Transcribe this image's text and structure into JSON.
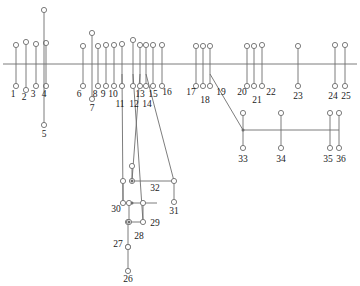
{
  "figure": {
    "kind": "single-line-network-diagram",
    "width": 360,
    "height": 286,
    "background_color": "#ffffff",
    "line_color": "#6e6e6e",
    "node_stroke_color": "#6e6e6e",
    "node_fill_color": "#ffffff",
    "label_color": "#1a1a1a",
    "node_radius": 2.6,
    "stroke_width": 0.9
  },
  "buses": [
    {
      "name": "main-bus",
      "x1": 3,
      "y1": 64,
      "x2": 357,
      "y2": 64
    },
    {
      "name": "lower-right-bus",
      "x1": 243,
      "y1": 130,
      "x2": 339,
      "y2": 130
    },
    {
      "name": "node-32-bus",
      "x1": 132,
      "y1": 181,
      "x2": 174,
      "y2": 181
    },
    {
      "name": "node-29-bus",
      "x1": 132,
      "y1": 203,
      "x2": 157,
      "y2": 203
    },
    {
      "name": "node-28-bus",
      "x1": 129,
      "y1": 222,
      "x2": 143,
      "y2": 222
    }
  ],
  "feeders": [
    {
      "label": "1",
      "x": 16,
      "top_y": 45,
      "bottom_y": 86,
      "label_x": 13,
      "label_y": 90
    },
    {
      "label": "2",
      "x": 26,
      "top_y": 42,
      "bottom_y": 90,
      "label_x": 24,
      "label_y": 93
    },
    {
      "label": "3",
      "x": 36,
      "top_y": 44,
      "bottom_y": 86,
      "label_x": 33,
      "label_y": 90
    },
    {
      "label": "4",
      "x": 46,
      "top_y": 43,
      "bottom_y": 86,
      "label_x": 44,
      "label_y": 90
    },
    {
      "label": "5",
      "x": 44,
      "top_y": 10,
      "bottom_y": 125,
      "label_x": 44,
      "label_y": 130
    },
    {
      "label": "6",
      "x": 83,
      "top_y": 46,
      "bottom_y": 86,
      "label_x": 79,
      "label_y": 90
    },
    {
      "label": "7",
      "x": 92,
      "top_y": 33,
      "bottom_y": 99,
      "label_x": 92,
      "label_y": 104
    },
    {
      "label": "8",
      "x": 98,
      "top_y": 46,
      "bottom_y": 86,
      "label_x": 95,
      "label_y": 90
    },
    {
      "label": "9",
      "x": 106,
      "top_y": 45,
      "bottom_y": 86,
      "label_x": 103,
      "label_y": 90
    },
    {
      "label": "10",
      "x": 114,
      "top_y": 45,
      "bottom_y": 86,
      "label_x": 113,
      "label_y": 90
    },
    {
      "label": "11",
      "x": 122,
      "top_y": 44,
      "bottom_y": 86,
      "label_x": 120,
      "label_y": 100
    },
    {
      "label": "12",
      "x": 133,
      "top_y": 40,
      "bottom_y": 86,
      "label_x": 134,
      "label_y": 100
    },
    {
      "label": "13",
      "x": 140,
      "top_y": 45,
      "bottom_y": 86,
      "label_x": 140,
      "label_y": 90
    },
    {
      "label": "14",
      "x": 146,
      "top_y": 45,
      "bottom_y": 86,
      "label_x": 147,
      "label_y": 100
    },
    {
      "label": "15",
      "x": 153,
      "top_y": 45,
      "bottom_y": 86,
      "label_x": 153,
      "label_y": 90
    },
    {
      "label": "16",
      "x": 162,
      "top_y": 45,
      "bottom_y": 86,
      "label_x": 167,
      "label_y": 88
    },
    {
      "label": "17",
      "x": 196,
      "top_y": 46,
      "bottom_y": 86,
      "label_x": 191,
      "label_y": 88
    },
    {
      "label": "18",
      "x": 203,
      "top_y": 46,
      "bottom_y": 86,
      "label_x": 205,
      "label_y": 96
    },
    {
      "label": "19",
      "x": 210,
      "top_y": 46,
      "bottom_y": 86,
      "label_x": 221,
      "label_y": 88
    },
    {
      "label": "20",
      "x": 247,
      "top_y": 46,
      "bottom_y": 86,
      "label_x": 242,
      "label_y": 88
    },
    {
      "label": "21",
      "x": 254,
      "top_y": 46,
      "bottom_y": 86,
      "label_x": 257,
      "label_y": 96
    },
    {
      "label": "22",
      "x": 262,
      "top_y": 45,
      "bottom_y": 86,
      "label_x": 271,
      "label_y": 88
    },
    {
      "label": "23",
      "x": 298,
      "top_y": 46,
      "bottom_y": 86,
      "label_x": 298,
      "label_y": 92
    },
    {
      "label": "24",
      "x": 335,
      "top_y": 45,
      "bottom_y": 86,
      "label_x": 333,
      "label_y": 92
    },
    {
      "label": "25",
      "x": 345,
      "top_y": 45,
      "bottom_y": 86,
      "label_x": 346,
      "label_y": 92
    },
    {
      "label": "26",
      "x": 128,
      "top_y": 247,
      "bottom_y": 271,
      "label_x": 128,
      "label_y": 275
    },
    {
      "label": "27",
      "x": 128,
      "top_y": 222,
      "bottom_y": 247,
      "label_x": 118,
      "label_y": 240
    },
    {
      "label": "28",
      "x": 129,
      "top_y": 203,
      "bottom_y": 222,
      "label_x": 139,
      "label_y": 232
    },
    {
      "label": "29",
      "x": 143,
      "top_y": 203,
      "bottom_y": 222,
      "label_x": 155,
      "label_y": 219
    },
    {
      "label": "30",
      "x": 123,
      "top_y": 181,
      "bottom_y": 203,
      "label_x": 116,
      "label_y": 205
    },
    {
      "label": "31",
      "x": 174,
      "top_y": 181,
      "bottom_y": 202,
      "label_x": 174,
      "label_y": 207
    },
    {
      "label": "32",
      "x": 132,
      "top_y": 166,
      "bottom_y": 181,
      "label_x": 155,
      "label_y": 184
    },
    {
      "label": "33",
      "x": 243,
      "top_y": 113,
      "bottom_y": 148,
      "label_x": 243,
      "label_y": 155
    },
    {
      "label": "34",
      "x": 281,
      "top_y": 113,
      "bottom_y": 148,
      "label_x": 281,
      "label_y": 155
    },
    {
      "label": "35",
      "x": 330,
      "top_y": 113,
      "bottom_y": 148,
      "label_x": 328,
      "label_y": 155
    },
    {
      "label": "36",
      "x": 339,
      "top_y": 113,
      "bottom_y": 148,
      "label_x": 341,
      "label_y": 155
    }
  ],
  "tie_lines": [
    {
      "name": "tie-19-to-33",
      "x1": 210,
      "y1": 74,
      "x2": 243,
      "y2": 130
    },
    {
      "name": "tie-11-to-30",
      "x1": 122,
      "y1": 74,
      "x2": 123,
      "y2": 203
    },
    {
      "name": "tie-12-to-29",
      "x1": 133,
      "y1": 74,
      "x2": 143,
      "y2": 222
    },
    {
      "name": "tie-14-to-31",
      "x1": 146,
      "y1": 74,
      "x2": 174,
      "y2": 181
    },
    {
      "name": "tie-13-to-32",
      "x1": 140,
      "y1": 74,
      "x2": 132,
      "y2": 181
    }
  ],
  "node_dots": [
    {
      "name": "junction-32-left",
      "x": 132,
      "y": 181
    },
    {
      "name": "junction-29-left",
      "x": 132,
      "y": 203
    },
    {
      "name": "junction-28-left",
      "x": 129,
      "y": 222
    },
    {
      "name": "junction-33-bus",
      "x": 243,
      "y": 130
    }
  ]
}
